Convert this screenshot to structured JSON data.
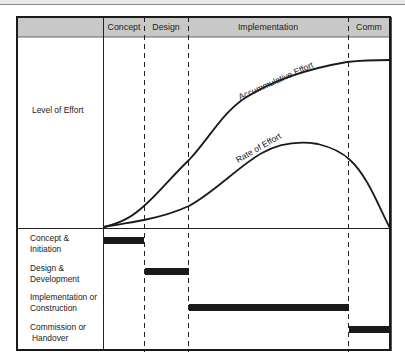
{
  "diagram": {
    "header": {
      "phases": [
        {
          "label": "Concept"
        },
        {
          "label": "Design"
        },
        {
          "label": "Implementation"
        },
        {
          "label": "Comm"
        }
      ]
    },
    "upper_panel": {
      "row_label": "Level of Effort",
      "curves": [
        {
          "name": "Accummulative Effort",
          "label": "Accummulative Effort"
        },
        {
          "name": "Rate of Effort",
          "label": "Rate of Effort"
        }
      ]
    },
    "lower_panel": {
      "rows": [
        {
          "line1": "Concept &",
          "line2": "Initiation",
          "phase": "Concept"
        },
        {
          "line1": "Design &",
          "line2": "Development",
          "phase": "Design"
        },
        {
          "line1": "Implementation or",
          "line2": "Construction",
          "phase": "Implementation"
        },
        {
          "line1": "Commission or",
          "line2": "Handover",
          "phase": "Comm"
        }
      ]
    },
    "colors": {
      "header_fill": "#c8c8c8",
      "line": "#1a1a1a",
      "bar": "#1a1a1a"
    }
  }
}
